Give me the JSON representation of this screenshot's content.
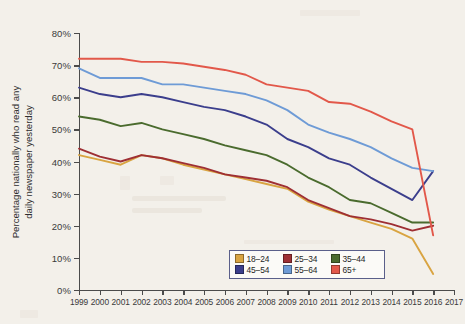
{
  "chart_data": {
    "type": "line",
    "title": "",
    "xlabel": "",
    "ylabel": "Percentage nationally who read any daily newspaper yesterday",
    "ylabel_line1": "Percentage nationally who read any",
    "ylabel_line2": "daily newspaper yesterday",
    "xlim": [
      1999,
      2017
    ],
    "ylim": [
      0,
      80
    ],
    "grid": false,
    "legend_position": "bottom-right",
    "x": [
      1999,
      2000,
      2001,
      2002,
      2003,
      2004,
      2005,
      2006,
      2007,
      2008,
      2009,
      2010,
      2011,
      2012,
      2013,
      2014,
      2015,
      2016
    ],
    "xtick_labels": [
      "1999",
      "2000",
      "2001",
      "2002",
      "2003",
      "2004",
      "2005",
      "2006",
      "2007",
      "2008",
      "2009",
      "2010",
      "2011",
      "2012",
      "2013",
      "2014",
      "2015",
      "2016",
      "2017"
    ],
    "ytick_labels": [
      "0%",
      "10%",
      "20%",
      "30%",
      "40%",
      "50%",
      "60%",
      "70%",
      "80%"
    ],
    "ytick_values": [
      0,
      10,
      20,
      30,
      40,
      50,
      60,
      70,
      80
    ],
    "series": [
      {
        "name": "18–24",
        "color": "#d9a441",
        "values": [
          42,
          40.5,
          39,
          42,
          41,
          39,
          37.5,
          36,
          34.5,
          33,
          31.5,
          27.5,
          25,
          23,
          21,
          19,
          16,
          5
        ]
      },
      {
        "name": "25–34",
        "color": "#9e2f34",
        "values": [
          44,
          41.5,
          40,
          42,
          41,
          39.5,
          38,
          36,
          35,
          34,
          32,
          28,
          25.5,
          23,
          22,
          20.5,
          18.5,
          20
        ]
      },
      {
        "name": "35–44",
        "color": "#4a6b2e",
        "values": [
          54,
          53,
          51,
          52,
          50,
          48.5,
          47,
          45,
          43.5,
          42,
          39,
          35,
          32,
          28,
          27,
          24,
          21,
          21
        ]
      },
      {
        "name": "45–54",
        "color": "#3b3e8c",
        "values": [
          63,
          61,
          60,
          61,
          60,
          58.5,
          57,
          56,
          54,
          51.5,
          47,
          44.5,
          41,
          39,
          35,
          31.5,
          28,
          37
        ]
      },
      {
        "name": "55–64",
        "color": "#6e9bd6",
        "values": [
          69,
          66,
          66,
          66,
          64,
          64,
          63,
          62,
          61,
          59,
          56,
          51.5,
          49,
          47,
          44.5,
          41,
          38,
          37
        ]
      },
      {
        "name": "65+",
        "color": "#e2584a",
        "values": [
          72,
          72,
          72,
          71,
          71,
          70.5,
          69.5,
          68.5,
          67,
          64,
          63,
          62,
          58.5,
          58,
          55.5,
          52.5,
          50,
          17
        ]
      }
    ]
  },
  "legend": {
    "rows": [
      [
        {
          "label": "18–24",
          "color": "#d9a441"
        },
        {
          "label": "25–34",
          "color": "#9e2f34"
        },
        {
          "label": "35–44",
          "color": "#4a6b2e"
        }
      ],
      [
        {
          "label": "45–54",
          "color": "#3b3e8c"
        },
        {
          "label": "55–64",
          "color": "#6e9bd6"
        },
        {
          "label": "65+",
          "color": "#e2584a"
        }
      ]
    ]
  }
}
